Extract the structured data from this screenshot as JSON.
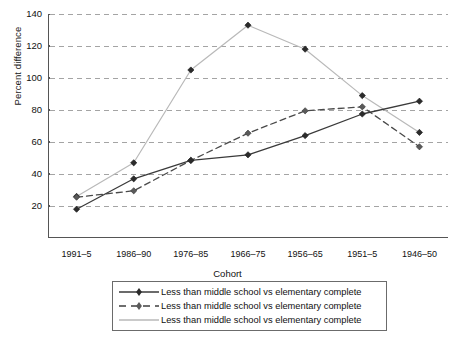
{
  "chart_data": {
    "type": "line",
    "title": "",
    "xlabel": "Cohort",
    "ylabel": "Percent difference",
    "categories": [
      "1991–5",
      "1986–90",
      "1976–85",
      "1966–75",
      "1956–65",
      "1951–5",
      "1946–50"
    ],
    "ylim": [
      0,
      140
    ],
    "yticks": [
      20,
      40,
      60,
      80,
      100,
      120,
      140
    ],
    "ytick_labels": [
      "20",
      "40",
      "60",
      "80",
      "100",
      "120",
      "140"
    ],
    "grid": "horizontal-dashed",
    "legend_position": "below-axis",
    "series": [
      {
        "name": "Less than middle school vs elementary complete",
        "style": "solid-with-diamond-markers",
        "color": "#3a3a3a",
        "values": [
          18,
          37,
          48.5,
          52,
          64,
          77.5,
          85.5
        ]
      },
      {
        "name": "Less than middle school vs elementary complete",
        "style": "dashed-with-diamond-markers",
        "color": "#4a4a4a",
        "values": [
          25.5,
          29.5,
          48.5,
          65.5,
          79.5,
          82,
          57
        ]
      },
      {
        "name": "Less than middle school vs elementary complete",
        "style": "solid-light-no-markers",
        "color": "#b9b9b9",
        "values": [
          26,
          47,
          105,
          133,
          118,
          89,
          66
        ]
      }
    ]
  },
  "axes": {
    "y_axis_title": "Percent difference",
    "x_axis_title": "Cohort"
  },
  "legend": {
    "entries": [
      {
        "label": "Less than middle school vs elementary complete"
      },
      {
        "label": "Less than middle school vs elementary complete"
      },
      {
        "label": "Less than middle school vs elementary complete"
      }
    ]
  },
  "colors": {
    "series_solid": "#3a3a3a",
    "series_dashed": "#4a4a4a",
    "series_light": "#b9b9b9",
    "grid": "#9a9a9a",
    "axis": "#555555",
    "text": "#111111",
    "background": "#ffffff"
  }
}
